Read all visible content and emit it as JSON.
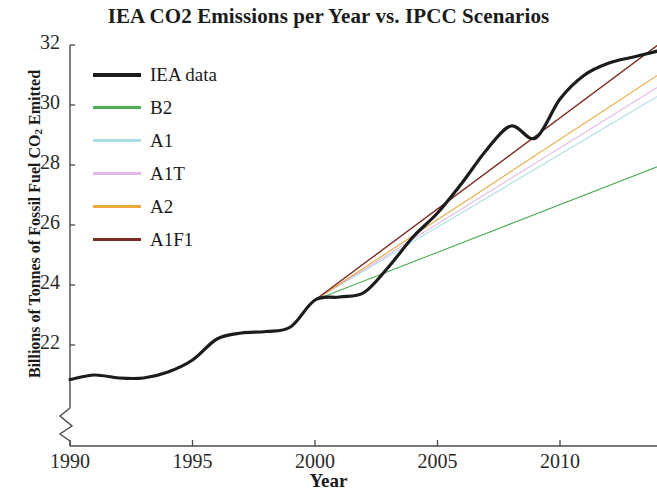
{
  "chart_data": {
    "type": "line",
    "title": "IEA CO2 Emissions per Year vs. IPCC Scenarios",
    "xlabel": "Year",
    "ylabel": "Billions of Tonnes of Fossil Fuel CO2 Emitted",
    "ylabel_main": "Billions of Tonnes of Fossil Fuel CO",
    "ylabel_sub": "2",
    "ylabel_tail": " Emitted",
    "xlim": [
      1990,
      2014
    ],
    "ylim": [
      20.4,
      32
    ],
    "y_axis_break": true,
    "grid": false,
    "legend_position": "upper-left-inside",
    "xticks": [
      1990,
      1995,
      2000,
      2005,
      2010
    ],
    "yticks": [
      22,
      24,
      26,
      28,
      30,
      32
    ],
    "xtick_labels": [
      "1990",
      "1995",
      "2000",
      "2005",
      "2010"
    ],
    "ytick_labels": [
      "22",
      "24",
      "26",
      "28",
      "30",
      "32"
    ],
    "series": [
      {
        "name": "IEA data",
        "color": "#1c1c1c",
        "width": 3.2,
        "x": [
          1990,
          1991,
          1992,
          1993,
          1994,
          1995,
          1996,
          1997,
          1998,
          1999,
          2000,
          2001,
          2002,
          2003,
          2004,
          2005,
          2006,
          2007,
          2008,
          2009,
          2010,
          2011,
          2012,
          2013,
          2014
        ],
        "values": [
          20.85,
          21.0,
          20.9,
          20.9,
          21.1,
          21.5,
          22.2,
          22.4,
          22.45,
          22.6,
          23.5,
          23.6,
          23.75,
          24.6,
          25.6,
          26.4,
          27.4,
          28.5,
          29.3,
          28.9,
          30.2,
          31.0,
          31.4,
          31.6,
          31.8
        ]
      },
      {
        "name": "B2",
        "color": "#4cad54",
        "width": 1.1,
        "x": [
          2000,
          2014
        ],
        "values": [
          23.5,
          27.95
        ]
      },
      {
        "name": "A1",
        "color": "#a9dfe5",
        "width": 1.1,
        "x": [
          2000,
          2014
        ],
        "values": [
          23.5,
          30.3
        ]
      },
      {
        "name": "A1T",
        "color": "#e3b7e8",
        "width": 1.1,
        "x": [
          2000,
          2014
        ],
        "values": [
          23.5,
          30.6
        ]
      },
      {
        "name": "A2",
        "color": "#e8a83a",
        "width": 1.1,
        "x": [
          2000,
          2014
        ],
        "values": [
          23.5,
          31.0
        ]
      },
      {
        "name": "A1F1",
        "color": "#7d2b23",
        "width": 1.4,
        "x": [
          2000,
          2014
        ],
        "values": [
          23.5,
          32.0
        ]
      }
    ],
    "annotations": {
      "scenario_origin_year": 2000,
      "scenario_origin_value": 23.5
    }
  },
  "legend": {
    "items": [
      {
        "label": "IEA data",
        "color": "#1c1c1c",
        "thickness": 4
      },
      {
        "label": "B2",
        "color": "#4cad54",
        "thickness": 3
      },
      {
        "label": "A1",
        "color": "#a9dfe5",
        "thickness": 3
      },
      {
        "label": "A1T",
        "color": "#e3b7e8",
        "thickness": 3
      },
      {
        "label": "A2",
        "color": "#e8a83a",
        "thickness": 3
      },
      {
        "label": "A1F1",
        "color": "#7d2b23",
        "thickness": 3.5
      }
    ]
  },
  "axes": {
    "axis_color": "#4a4a4a"
  }
}
